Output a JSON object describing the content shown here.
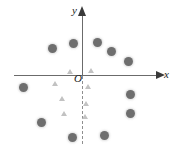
{
  "figure": {
    "title": "",
    "origin_label": "O",
    "x_axis_label": "x",
    "y_axis_label": "y"
  },
  "chart_data": {
    "type": "scatter",
    "title": "",
    "xlabel": "x",
    "ylabel": "y",
    "grid": false,
    "legend": null,
    "axis_style": {
      "x_axis": "solid with right arrowhead",
      "y_axis_positive": "solid with up arrowhead",
      "y_axis_negative": "dashed",
      "origin_label": "O",
      "axis_color": "#6b6b6b",
      "arrow_color": "#3a3a3a"
    },
    "series": [
      {
        "name": "circles",
        "marker": "circle",
        "color": "#6e6e6e",
        "points_px": [
          {
            "x": 52,
            "y": 48
          },
          {
            "x": 73,
            "y": 43
          },
          {
            "x": 97,
            "y": 42
          },
          {
            "x": 111,
            "y": 51
          },
          {
            "x": 128,
            "y": 61
          },
          {
            "x": 23,
            "y": 87
          },
          {
            "x": 130,
            "y": 94
          },
          {
            "x": 130,
            "y": 113
          },
          {
            "x": 41,
            "y": 122
          },
          {
            "x": 72,
            "y": 137
          },
          {
            "x": 104,
            "y": 135
          }
        ]
      },
      {
        "name": "triangles",
        "marker": "triangle",
        "color": "#c2c2c2",
        "points_px": [
          {
            "x": 70,
            "y": 72
          },
          {
            "x": 91,
            "y": 71
          },
          {
            "x": 55,
            "y": 84
          },
          {
            "x": 88,
            "y": 87
          },
          {
            "x": 62,
            "y": 99
          },
          {
            "x": 86,
            "y": 104
          },
          {
            "x": 64,
            "y": 114
          },
          {
            "x": 85,
            "y": 117
          }
        ]
      }
    ]
  }
}
